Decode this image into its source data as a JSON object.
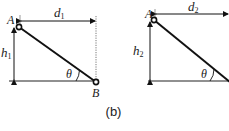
{
  "figure": {
    "caption": "(b)",
    "left_panel": {
      "point_top": "A",
      "point_bottom": "B",
      "horizontal_label": "d",
      "horizontal_sub": "1",
      "vertical_label": "h",
      "vertical_sub": "1",
      "angle_label": "θ"
    },
    "right_panel": {
      "point_top": "A",
      "horizontal_label": "d",
      "horizontal_sub": "2",
      "vertical_label": "h",
      "vertical_sub": "2",
      "angle_label": "θ"
    }
  }
}
